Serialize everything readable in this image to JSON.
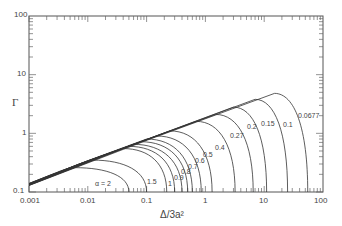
{
  "chart_data": {
    "type": "line",
    "title": "",
    "xlabel": "Δ/3a²",
    "ylabel": "Γ",
    "xscale": "log",
    "yscale": "log",
    "xlim": [
      0.001,
      100
    ],
    "ylim": [
      0.1,
      100
    ],
    "x_ticks": [
      "0.001",
      "0.01",
      "0.1",
      "1",
      "10",
      "100"
    ],
    "y_ticks": [
      "0.1",
      "1",
      "10",
      "100"
    ],
    "grid": false,
    "legend": "none; curves labeled inline by α",
    "envelope": {
      "x": [
        0.001,
        20
      ],
      "y": [
        0.14,
        5.0
      ]
    },
    "series": [
      {
        "name": "α=2",
        "peak_x": 0.006,
        "peak_y": 0.26,
        "end_x": 0.05
      },
      {
        "name": "1.5",
        "peak_x": 0.012,
        "peak_y": 0.35,
        "end_x": 0.1
      },
      {
        "name": "1",
        "peak_x": 0.04,
        "peak_y": 0.55,
        "end_x": 0.22
      },
      {
        "name": "0.9",
        "peak_x": 0.05,
        "peak_y": 0.6,
        "end_x": 0.3
      },
      {
        "name": "0.8",
        "peak_x": 0.06,
        "peak_y": 0.65,
        "end_x": 0.4
      },
      {
        "name": "0.7",
        "peak_x": 0.08,
        "peak_y": 0.72,
        "end_x": 0.5
      },
      {
        "name": "0.6",
        "peak_x": 0.1,
        "peak_y": 0.8,
        "end_x": 0.6
      },
      {
        "name": "0.5",
        "peak_x": 0.15,
        "peak_y": 0.9,
        "end_x": 0.85
      },
      {
        "name": "0.4",
        "peak_x": 0.25,
        "peak_y": 1.1,
        "end_x": 1.3
      },
      {
        "name": "0.27",
        "peak_x": 0.7,
        "peak_y": 1.6,
        "end_x": 3.2
      },
      {
        "name": "0.2",
        "peak_x": 1.5,
        "peak_y": 2.1,
        "end_x": 6.5
      },
      {
        "name": "0.15",
        "peak_x": 3,
        "peak_y": 2.8,
        "end_x": 11
      },
      {
        "name": "0.1",
        "peak_x": 7,
        "peak_y": 3.8,
        "end_x": 25
      },
      {
        "name": "0.0677",
        "peak_x": 15,
        "peak_y": 4.8,
        "end_x": 55
      }
    ]
  },
  "axes": {
    "xlabel": "Δ/3a²",
    "ylabel": "Γ",
    "x_ticks": [
      "0.001",
      "0.01",
      "0.1",
      "1",
      "10",
      "100"
    ],
    "y_ticks": [
      "100",
      "10",
      "1",
      "0.1"
    ]
  },
  "labels": [
    "α = 2",
    "1.5",
    "1",
    "0.9",
    "0.8",
    "0.7",
    "0.6",
    "0.5",
    "0.4",
    "0.27",
    "0.2",
    "0.15",
    "0.1",
    "0.0677"
  ]
}
